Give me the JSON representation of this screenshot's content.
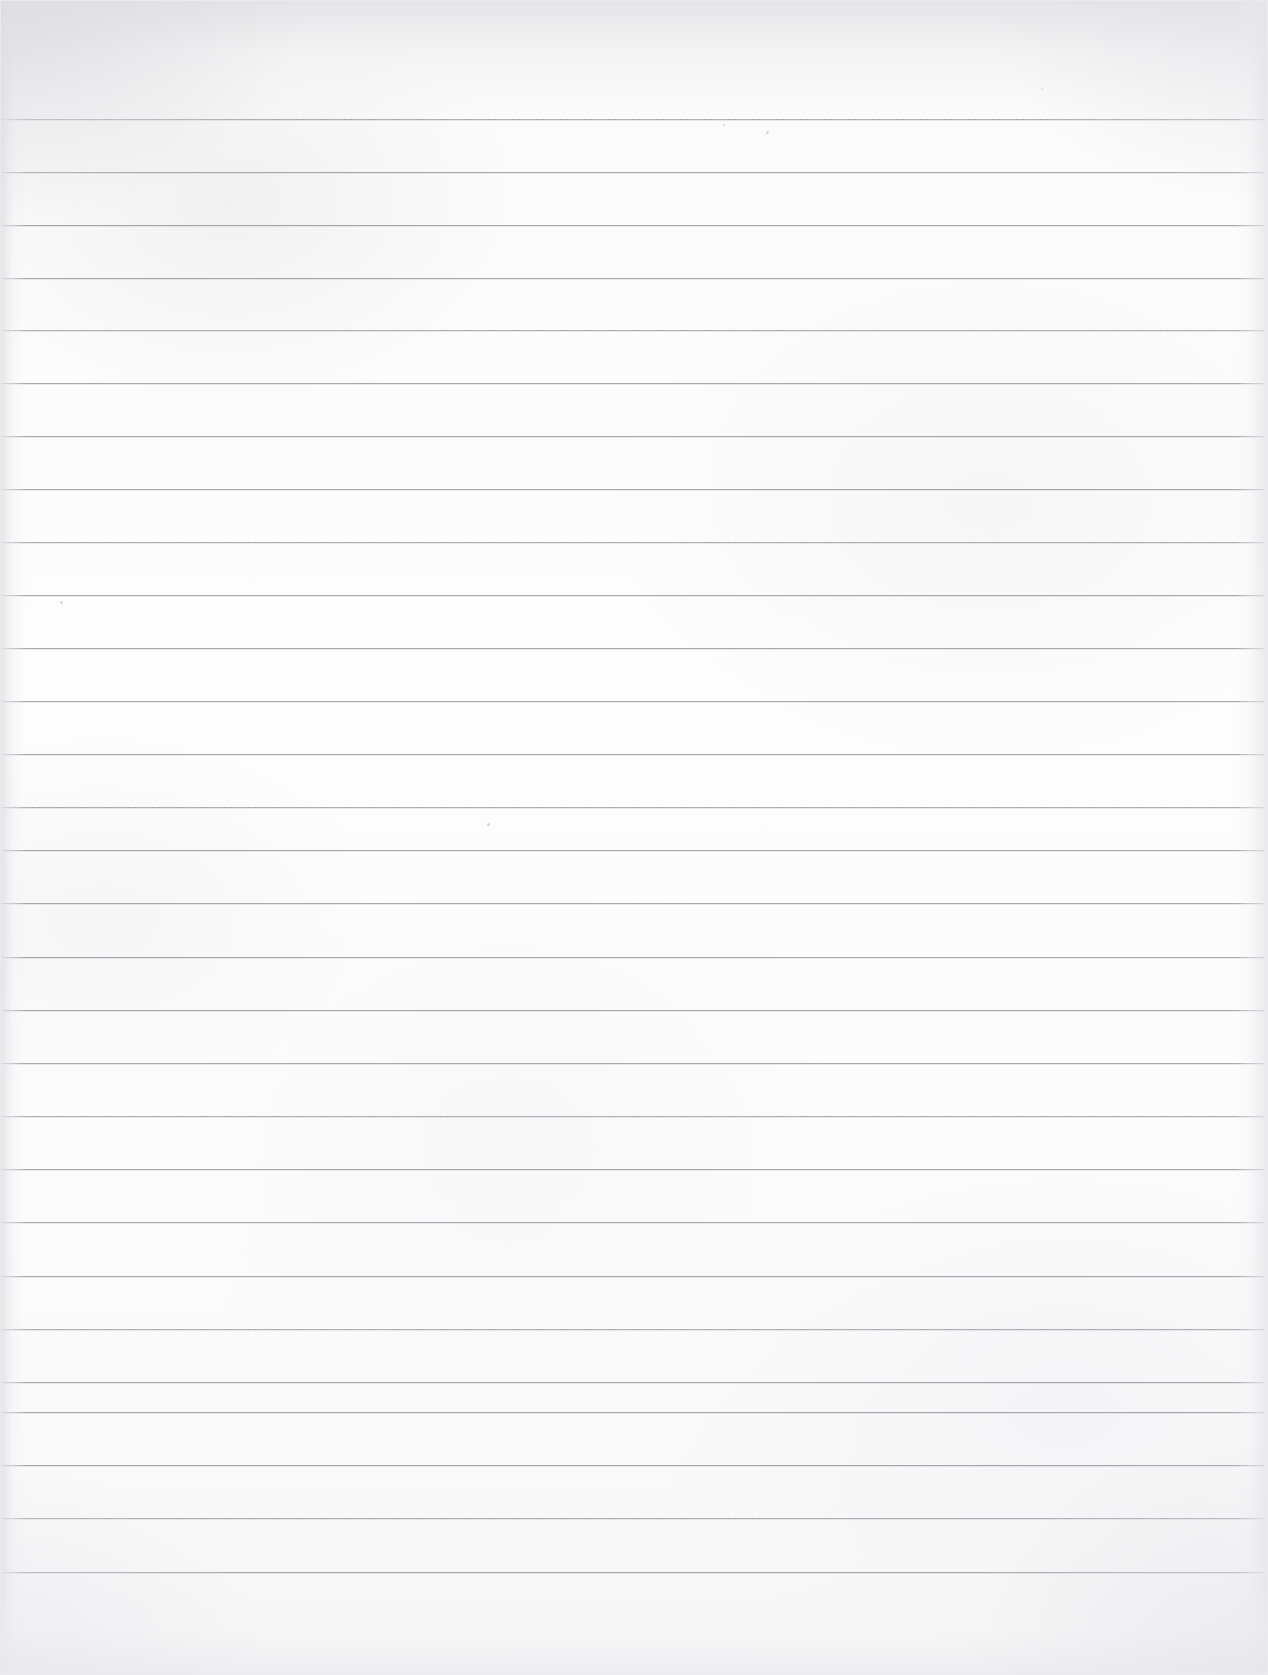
{
  "document": {
    "kind": "scanned-ruled-paper",
    "title": "Blank Ruled Notebook Page",
    "visible_text": "",
    "page_width_px": 1268,
    "page_height_px": 1675,
    "paper_color": "#fcfcfc",
    "background_color": "#ffffff"
  },
  "ruling": {
    "style": "wide-ruled horizontal lines",
    "line_color": "#96969c",
    "line_thickness_px": 1,
    "line_count": 28,
    "first_line_y": 119,
    "last_line_y": 1572,
    "spacing_px": 53.2,
    "line_start_x": 2,
    "line_end_x": 1264,
    "top_margin_px": 119,
    "bottom_margin_px": 103,
    "has_vertical_margin_rule": false,
    "lines": [
      {
        "y": 119,
        "start_x": 2,
        "end_x": 1264,
        "texture": "dotty"
      },
      {
        "y": 172,
        "start_x": 2,
        "end_x": 1264,
        "texture": "solid"
      },
      {
        "y": 225,
        "start_x": 2,
        "end_x": 1264,
        "texture": "solid"
      },
      {
        "y": 278,
        "start_x": 2,
        "end_x": 1264,
        "texture": "solid"
      },
      {
        "y": 330,
        "start_x": 2,
        "end_x": 1264,
        "texture": "dotty"
      },
      {
        "y": 383,
        "start_x": 2,
        "end_x": 1264,
        "texture": "solid"
      },
      {
        "y": 436,
        "start_x": 2,
        "end_x": 1264,
        "texture": "solid"
      },
      {
        "y": 489,
        "start_x": 2,
        "end_x": 1264,
        "texture": "solid"
      },
      {
        "y": 542,
        "start_x": 2,
        "end_x": 1264,
        "texture": "dotty"
      },
      {
        "y": 595,
        "start_x": 2,
        "end_x": 1264,
        "texture": "solid"
      },
      {
        "y": 648,
        "start_x": 2,
        "end_x": 1264,
        "texture": "solid"
      },
      {
        "y": 701,
        "start_x": 2,
        "end_x": 1264,
        "texture": "solid"
      },
      {
        "y": 754,
        "start_x": 2,
        "end_x": 1264,
        "texture": "solid"
      },
      {
        "y": 807,
        "start_x": 2,
        "end_x": 1264,
        "texture": "dotty"
      },
      {
        "y": 850,
        "start_x": 2,
        "end_x": 1264,
        "texture": "solid"
      },
      {
        "y": 903,
        "start_x": 2,
        "end_x": 1264,
        "texture": "solid"
      },
      {
        "y": 957,
        "start_x": 2,
        "end_x": 1264,
        "texture": "solid"
      },
      {
        "y": 1010,
        "start_x": 2,
        "end_x": 1264,
        "texture": "solid"
      },
      {
        "y": 1063,
        "start_x": 2,
        "end_x": 1264,
        "texture": "solid"
      },
      {
        "y": 1116,
        "start_x": 2,
        "end_x": 1264,
        "texture": "dotty"
      },
      {
        "y": 1169,
        "start_x": 2,
        "end_x": 1264,
        "texture": "solid"
      },
      {
        "y": 1222,
        "start_x": 2,
        "end_x": 1264,
        "texture": "solid"
      },
      {
        "y": 1276,
        "start_x": 2,
        "end_x": 1264,
        "texture": "solid"
      },
      {
        "y": 1329,
        "start_x": 2,
        "end_x": 1264,
        "texture": "dotty"
      },
      {
        "y": 1382,
        "start_x": 2,
        "end_x": 1264,
        "texture": "solid"
      },
      {
        "y": 1412,
        "start_x": 2,
        "end_x": 1264,
        "texture": "solid"
      },
      {
        "y": 1465,
        "start_x": 2,
        "end_x": 1264,
        "texture": "solid"
      },
      {
        "y": 1518,
        "start_x": 2,
        "end_x": 1264,
        "texture": "dotty"
      },
      {
        "y": 1572,
        "start_x": 2,
        "end_x": 1264,
        "texture": "solid"
      }
    ]
  },
  "artifacts": {
    "specks": [
      {
        "x": 766,
        "y": 131,
        "size": 3
      },
      {
        "x": 60,
        "y": 601,
        "size": 3
      },
      {
        "x": 487,
        "y": 823,
        "size": 3
      },
      {
        "x": 723,
        "y": 124,
        "size": 2
      },
      {
        "x": 1041,
        "y": 88,
        "size": 2
      }
    ],
    "vignette": "edges and corners slightly darker from flatbed scan",
    "edge_shade_color": "#e1e1e6"
  }
}
